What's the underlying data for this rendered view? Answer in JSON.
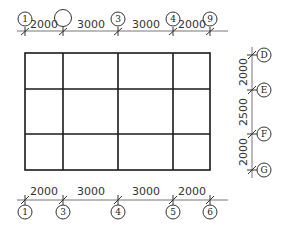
{
  "drawing": {
    "type": "structural grid plan",
    "top_axis": {
      "labels": [
        "1",
        "",
        "3",
        "4",
        "9"
      ],
      "dimensions": [
        "2000",
        "3000",
        "3000",
        "2000"
      ]
    },
    "bottom_axis": {
      "labels": [
        "1",
        "3",
        "4",
        "5",
        "6"
      ],
      "dimensions": [
        "2000",
        "3000",
        "3000",
        "2000"
      ]
    },
    "right_axis": {
      "labels": [
        "D",
        "E",
        "F",
        "G"
      ],
      "dimensions": [
        "2000",
        "2500",
        "2000"
      ]
    },
    "grid": {
      "columns": 4,
      "rows": 3
    }
  }
}
